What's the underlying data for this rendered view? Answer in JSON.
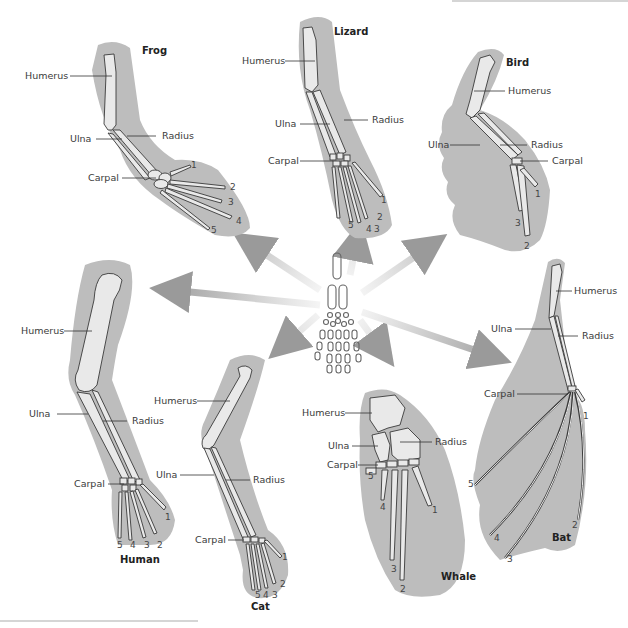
{
  "diagram": {
    "type": "homologous-forelimb-comparison",
    "center": {
      "label": "ancestral-tetrapod-limb"
    },
    "bone_labels": {
      "humerus": "Humerus",
      "ulna": "Ulna",
      "radius": "Radius",
      "carpal": "Carpal"
    },
    "organisms": [
      {
        "id": "frog",
        "name": "Frog",
        "digits": [
          "1",
          "2",
          "3",
          "4",
          "5"
        ]
      },
      {
        "id": "lizard",
        "name": "Lizard",
        "digits": [
          "1",
          "2",
          "3",
          "4",
          "5"
        ]
      },
      {
        "id": "bird",
        "name": "Bird",
        "digits": [
          "1",
          "2",
          "3"
        ]
      },
      {
        "id": "human",
        "name": "Human",
        "digits": [
          "1",
          "2",
          "3",
          "4",
          "5"
        ]
      },
      {
        "id": "cat",
        "name": "Cat",
        "digits": [
          "1",
          "2",
          "3",
          "4",
          "5"
        ]
      },
      {
        "id": "whale",
        "name": "Whale",
        "digits": [
          "1",
          "2",
          "3",
          "4",
          "5"
        ]
      },
      {
        "id": "bat",
        "name": "Bat",
        "digits": [
          "1",
          "2",
          "3",
          "4",
          "5"
        ]
      }
    ],
    "colors": {
      "silhouette": "#bdbdbd",
      "bone_fill": "#e9e9e9",
      "bone_stroke": "#3a3a3a",
      "arrow": "#9a9a9a"
    }
  }
}
